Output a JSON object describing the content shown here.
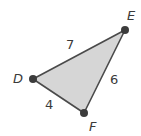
{
  "diagram": {
    "type": "triangle",
    "fill_color": "#d6d6d6",
    "edge_color": "#4a4a4a",
    "vertex_color": "#3c3c3c",
    "vertices": [
      {
        "label": "D",
        "x": 33,
        "y": 79
      },
      {
        "label": "E",
        "x": 125,
        "y": 30
      },
      {
        "label": "F",
        "x": 84,
        "y": 113
      }
    ],
    "sides": [
      {
        "endpoints": "DE",
        "length": "7"
      },
      {
        "endpoints": "EF",
        "length": "6"
      },
      {
        "endpoints": "DF",
        "length": "4"
      }
    ]
  }
}
